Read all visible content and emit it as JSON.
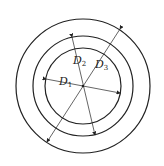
{
  "diagram": {
    "type": "concentric-circles",
    "center": [
      83,
      86
    ],
    "circles": [
      {
        "name": "inner",
        "radius": 38
      },
      {
        "name": "middle",
        "radius": 50
      },
      {
        "name": "outer",
        "radius": 67
      }
    ],
    "labels": [
      {
        "base": "D",
        "sub": "1",
        "meaning": "inner diameter"
      },
      {
        "base": "D",
        "sub": "2",
        "meaning": "middle diameter"
      },
      {
        "base": "D",
        "sub": "3",
        "meaning": "outer diameter"
      }
    ],
    "stroke_color": "#222222"
  }
}
